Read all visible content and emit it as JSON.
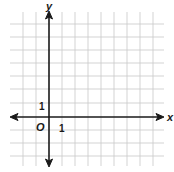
{
  "diagram": {
    "type": "coordinate-plane",
    "x_axis_label": "x",
    "y_axis_label": "y",
    "origin_label": "O",
    "x_tick_label": "1",
    "y_tick_label": "1",
    "grid": {
      "columns": 11,
      "rows": 11,
      "x_range": [
        -2,
        8
      ],
      "y_range": [
        -3,
        7
      ]
    },
    "colors": {
      "grid": "#c8c8c8",
      "axis": "#1a1a1a",
      "background": "#ffffff"
    }
  }
}
